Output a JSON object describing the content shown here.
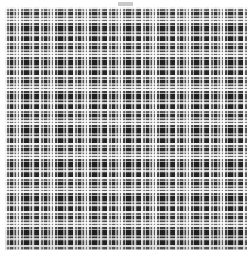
{
  "canvas": {
    "width": 252,
    "height": 253,
    "background": "#ffffff"
  },
  "top_marker": {
    "label": "",
    "x": 118,
    "y": 2,
    "width": 15,
    "height": 4,
    "color": "#c9c9c9"
  },
  "swatch": {
    "name": "plaid fabric swatch",
    "x": 5,
    "y": 7,
    "width": 242,
    "height": 243,
    "base_color": "#0d0d0d",
    "weave": "balanced tartan check (warp = weft)",
    "repeat_px": 34,
    "palette": {
      "ground": "#0d0d0d",
      "shadow": "#171717",
      "dark_gray": "#2b2b2b",
      "mid_gray": "#4f4f4f",
      "light_gray": "#8f8f8f",
      "pale": "#c2c2c2",
      "white": "#f2f2f2"
    },
    "sett": [
      {
        "offset": 0,
        "width": 2,
        "color": "#e8e8e8",
        "name": "guard-white"
      },
      {
        "offset": 2,
        "width": 2,
        "color": "#4f4f4f",
        "name": "mid"
      },
      {
        "offset": 4,
        "width": 1,
        "color": "#b5b5b5",
        "name": "pale-pin"
      },
      {
        "offset": 5,
        "width": 3,
        "color": "#1a1a1a",
        "name": "ground"
      },
      {
        "offset": 8,
        "width": 2,
        "color": "#9a9a9a",
        "name": "light"
      },
      {
        "offset": 10,
        "width": 1,
        "color": "#3a3a3a",
        "name": "dark-pin"
      },
      {
        "offset": 11,
        "width": 2,
        "color": "#d8d8d8",
        "name": "pale"
      },
      {
        "offset": 13,
        "width": 1,
        "color": "#5a5a5a",
        "name": "mid-pin"
      },
      {
        "offset": 14,
        "width": 2,
        "color": "#ededed",
        "name": "white"
      },
      {
        "offset": 16,
        "width": 2,
        "color": "#2e2e2e",
        "name": "dark"
      },
      {
        "offset": 18,
        "width": 1,
        "color": "#a5a5a5",
        "name": "light-pin"
      },
      {
        "offset": 19,
        "width": 5,
        "color": "#101010",
        "name": "ground-block"
      },
      {
        "offset": 24,
        "width": 2,
        "color": "#8a8a8a",
        "name": "light"
      },
      {
        "offset": 26,
        "width": 1,
        "color": "#232323",
        "name": "dark-pin"
      },
      {
        "offset": 27,
        "width": 2,
        "color": "#c8c8c8",
        "name": "pale"
      },
      {
        "offset": 29,
        "width": 1,
        "color": "#454545",
        "name": "mid-pin"
      },
      {
        "offset": 30,
        "width": 4,
        "color": "#141414",
        "name": "ground-block"
      }
    ]
  }
}
